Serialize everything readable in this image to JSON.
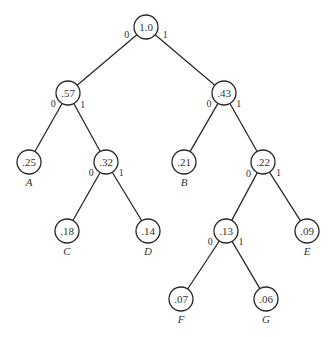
{
  "diagram": {
    "type": "huffman-tree",
    "node_radius": 12,
    "colors": {
      "line": "#2a2a2a",
      "text": "#333333",
      "background": "#ffffff"
    },
    "nodes": [
      {
        "id": "n0",
        "value": "1.0",
        "x": 146,
        "y": 27
      },
      {
        "id": "n1",
        "value": ".57",
        "x": 68,
        "y": 93
      },
      {
        "id": "n2",
        "value": ".43",
        "x": 224,
        "y": 93
      },
      {
        "id": "n3",
        "value": ".25",
        "x": 29,
        "y": 162,
        "leaf": "A"
      },
      {
        "id": "n4",
        "value": ".32",
        "x": 106,
        "y": 162
      },
      {
        "id": "n5",
        "value": ".21",
        "x": 184,
        "y": 162,
        "leaf": "B"
      },
      {
        "id": "n6",
        "value": ".22",
        "x": 263,
        "y": 162
      },
      {
        "id": "n7",
        "value": ".18",
        "x": 67,
        "y": 231,
        "leaf": "C"
      },
      {
        "id": "n8",
        "value": ".14",
        "x": 148,
        "y": 231,
        "leaf": "D"
      },
      {
        "id": "n9",
        "value": ".13",
        "x": 226,
        "y": 231
      },
      {
        "id": "n10",
        "value": ".09",
        "x": 307,
        "y": 231,
        "leaf": "E"
      },
      {
        "id": "n11",
        "value": ".07",
        "x": 181,
        "y": 299,
        "leaf": "F"
      },
      {
        "id": "n12",
        "value": ".06",
        "x": 266,
        "y": 299,
        "leaf": "G"
      }
    ],
    "edges": [
      {
        "from": "n0",
        "to": "n1",
        "label": "0"
      },
      {
        "from": "n0",
        "to": "n2",
        "label": "1"
      },
      {
        "from": "n1",
        "to": "n3",
        "label": "0"
      },
      {
        "from": "n1",
        "to": "n4",
        "label": "1"
      },
      {
        "from": "n2",
        "to": "n5",
        "label": "0"
      },
      {
        "from": "n2",
        "to": "n6",
        "label": "1"
      },
      {
        "from": "n4",
        "to": "n7",
        "label": "0"
      },
      {
        "from": "n4",
        "to": "n8",
        "label": "1"
      },
      {
        "from": "n6",
        "to": "n9",
        "label": "0"
      },
      {
        "from": "n6",
        "to": "n10",
        "label": "1"
      },
      {
        "from": "n9",
        "to": "n11",
        "label": "0"
      },
      {
        "from": "n9",
        "to": "n12",
        "label": "1"
      }
    ]
  }
}
